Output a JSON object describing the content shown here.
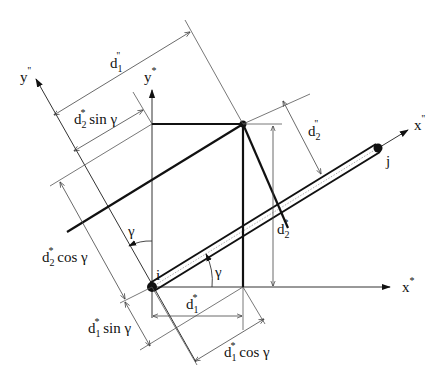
{
  "diagram": {
    "axes": {
      "x_star": {
        "base": "x",
        "sup": "*"
      },
      "y_star": {
        "base": "y",
        "sup": "*"
      },
      "x_local": {
        "base": "x",
        "sup": "''"
      },
      "y_local": {
        "base": "y",
        "sup": "''"
      }
    },
    "nodes": {
      "i": "i",
      "j": "j"
    },
    "angles": {
      "gamma_beam": "γ",
      "gamma_axis": "γ"
    },
    "dimensions": {
      "d1_local": {
        "base": "d",
        "sub": "1",
        "sup": "''",
        "suffix": ""
      },
      "d2_local": {
        "base": "d",
        "sub": "2",
        "sup": "''",
        "suffix": ""
      },
      "d1_star": {
        "base": "d",
        "sub": "1",
        "sup": "*",
        "suffix": ""
      },
      "d2_star": {
        "base": "d",
        "sub": "2",
        "sup": "*",
        "suffix": ""
      },
      "d2_sin": {
        "base": "d",
        "sub": "2",
        "sup": "*",
        "suffix": " sin γ"
      },
      "d2_cos": {
        "base": "d",
        "sub": "2",
        "sup": "*",
        "suffix": " cos γ"
      },
      "d1_sin": {
        "base": "d",
        "sub": "1",
        "sup": "*",
        "suffix": " sin γ"
      },
      "d1_cos": {
        "base": "d",
        "sub": "1",
        "sup": "*",
        "suffix": " cos γ"
      }
    }
  }
}
